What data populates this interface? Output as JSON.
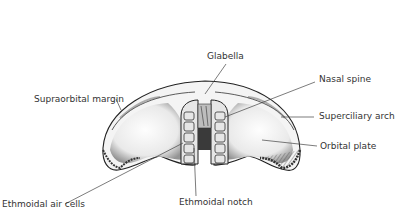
{
  "diagram": {
    "labels": {
      "glabella": "Glabella",
      "nasal_spine": "Nasal spine",
      "supraorbital_margin": "Supraorbital margin",
      "superciliary_arch": "Superciliary arch",
      "orbital_plate": "Orbital plate",
      "ethmoidal_air_cells": "Ethmoidal air cells",
      "ethmoidal_notch": "Ethmoidal notch"
    },
    "colors": {
      "ink": "#333333",
      "background": "#ffffff"
    }
  }
}
